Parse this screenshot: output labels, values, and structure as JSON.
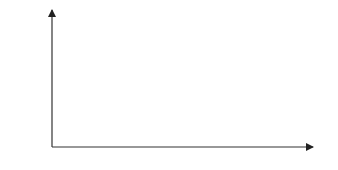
{
  "diagram": {
    "y_axis_label": {
      "main": "R",
      "sub": "B",
      "suffix": "(ω)"
    },
    "x_axis_label": "ω",
    "points": [
      {
        "name": "R",
        "sub": "1",
        "tick_sub": "1",
        "solid_after": true
      },
      {
        "name": "R",
        "sub": "2",
        "tick_sub": "2",
        "solid_after": true
      },
      {
        "name": "R",
        "sub": "3",
        "tick_sub": "3",
        "solid_after": false
      },
      {
        "name": "",
        "sub": "",
        "tick_sub": "",
        "solid_after": false
      },
      {
        "name": "R",
        "sub": "N−2",
        "tick_sub": "N−2",
        "solid_after": true
      },
      {
        "name": "R",
        "sub": "N−1",
        "tick_sub": "N−1",
        "solid_after": true
      },
      {
        "name": "R",
        "sub": "N",
        "tick_sub": "N",
        "solid_after": false
      }
    ],
    "tick_symbol": "ω"
  }
}
